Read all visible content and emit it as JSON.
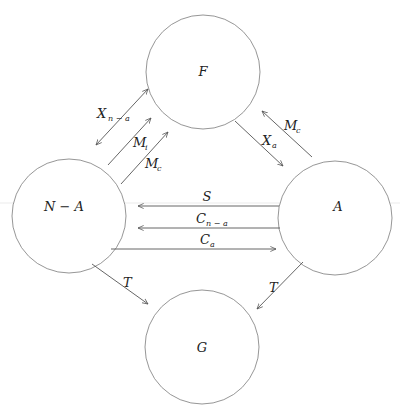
{
  "diagram": {
    "type": "flow-diagram",
    "nodes": [
      {
        "id": "F",
        "label": "F"
      },
      {
        "id": "NA",
        "label": "N − A"
      },
      {
        "id": "A",
        "label": "A"
      },
      {
        "id": "G",
        "label": "G"
      }
    ],
    "edges": [
      {
        "id": "x_n_a",
        "from": "F",
        "to": "NA",
        "base": "X",
        "sub": "n − a",
        "bidirectional": true
      },
      {
        "id": "m_i",
        "from": "NA",
        "to": "F",
        "base": "M",
        "sub": "i"
      },
      {
        "id": "m_c_left",
        "from": "NA",
        "to": "F",
        "base": "M",
        "sub": "c"
      },
      {
        "id": "x_a",
        "from": "F",
        "to": "A",
        "base": "X",
        "sub": "a"
      },
      {
        "id": "m_c_right",
        "from": "A",
        "to": "F",
        "base": "M",
        "sub": "c"
      },
      {
        "id": "s",
        "from": "A",
        "to": "NA",
        "base": "S",
        "sub": ""
      },
      {
        "id": "c_n_a",
        "from": "A",
        "to": "NA",
        "base": "C",
        "sub": "n − a"
      },
      {
        "id": "c_a",
        "from": "NA",
        "to": "A",
        "base": "C",
        "sub": "a"
      },
      {
        "id": "t_left",
        "from": "NA",
        "to": "G",
        "base": "T",
        "sub": ""
      },
      {
        "id": "t_right",
        "from": "A",
        "to": "G",
        "base": "T",
        "sub": ""
      }
    ]
  }
}
